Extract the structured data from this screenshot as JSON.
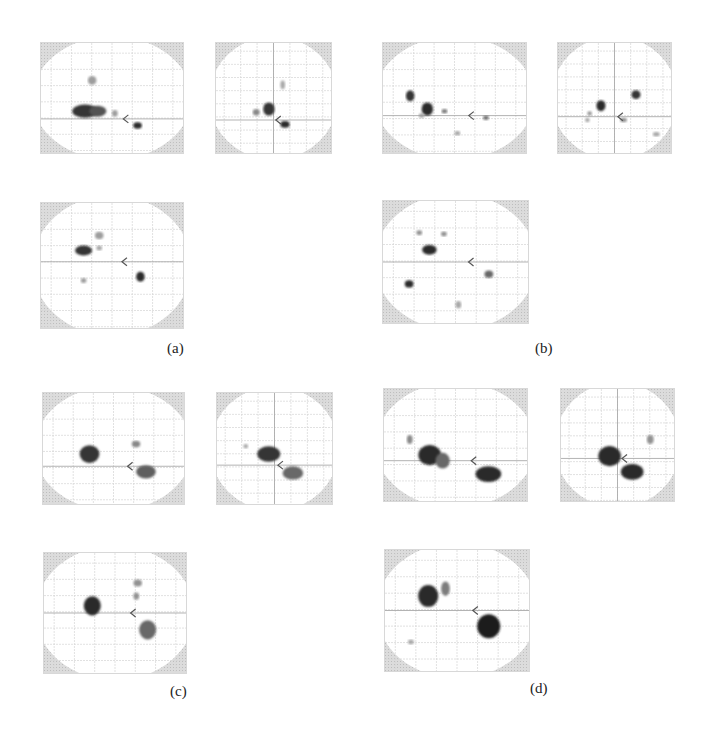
{
  "figure": {
    "panels": [
      {
        "id": "a",
        "label": "(a)",
        "views": {
          "sagittal": {
            "x": 40,
            "y": 42,
            "w": 142,
            "h": 110,
            "blobs": [
              [
                0.36,
                0.34,
                0.03,
                0.04,
                0.35
              ],
              [
                0.31,
                0.62,
                0.09,
                0.06,
                0.85
              ],
              [
                0.4,
                0.62,
                0.06,
                0.05,
                0.7
              ],
              [
                0.52,
                0.64,
                0.02,
                0.03,
                0.35
              ],
              [
                0.68,
                0.75,
                0.03,
                0.03,
                0.9
              ]
            ],
            "arrow": [
              0.58,
              0.69
            ]
          },
          "coronal": {
            "x": 215,
            "y": 42,
            "w": 115,
            "h": 110,
            "blobs": [
              [
                0.58,
                0.38,
                0.02,
                0.04,
                0.3
              ],
              [
                0.46,
                0.6,
                0.05,
                0.06,
                0.85
              ],
              [
                0.35,
                0.63,
                0.03,
                0.03,
                0.45
              ],
              [
                0.6,
                0.74,
                0.04,
                0.03,
                0.9
              ]
            ],
            "arrow": [
              0.52,
              0.7
            ]
          },
          "axial": {
            "x": 40,
            "y": 202,
            "w": 142,
            "h": 125,
            "blobs": [
              [
                0.41,
                0.26,
                0.03,
                0.03,
                0.35
              ],
              [
                0.3,
                0.38,
                0.06,
                0.04,
                0.85
              ],
              [
                0.41,
                0.36,
                0.02,
                0.02,
                0.3
              ],
              [
                0.3,
                0.62,
                0.02,
                0.02,
                0.35
              ],
              [
                0.7,
                0.59,
                0.03,
                0.04,
                0.9
              ]
            ],
            "arrow": [
              0.57,
              0.47
            ]
          }
        },
        "label_pos": {
          "x": 167,
          "y": 340
        }
      },
      {
        "id": "b",
        "label": "(b)",
        "views": {
          "sagittal": {
            "x": 382,
            "y": 42,
            "w": 143,
            "h": 110,
            "blobs": [
              [
                0.19,
                0.48,
                0.03,
                0.05,
                0.85
              ],
              [
                0.31,
                0.6,
                0.04,
                0.06,
                0.9
              ],
              [
                0.27,
                0.66,
                0.02,
                0.02,
                0.35
              ],
              [
                0.43,
                0.62,
                0.02,
                0.02,
                0.5
              ],
              [
                0.72,
                0.68,
                0.02,
                0.02,
                0.55
              ],
              [
                0.52,
                0.82,
                0.02,
                0.02,
                0.3
              ]
            ],
            "arrow": [
              0.6,
              0.66
            ]
          },
          "coronal": {
            "x": 557,
            "y": 42,
            "w": 113,
            "h": 110,
            "blobs": [
              [
                0.38,
                0.57,
                0.04,
                0.05,
                0.9
              ],
              [
                0.28,
                0.64,
                0.02,
                0.02,
                0.4
              ],
              [
                0.26,
                0.7,
                0.02,
                0.02,
                0.3
              ],
              [
                0.69,
                0.47,
                0.04,
                0.04,
                0.85
              ],
              [
                0.58,
                0.7,
                0.03,
                0.02,
                0.4
              ],
              [
                0.87,
                0.83,
                0.03,
                0.02,
                0.3
              ]
            ],
            "arrow": [
              0.53,
              0.67
            ]
          },
          "axial": {
            "x": 382,
            "y": 200,
            "w": 145,
            "h": 122,
            "blobs": [
              [
                0.25,
                0.26,
                0.02,
                0.02,
                0.4
              ],
              [
                0.42,
                0.27,
                0.02,
                0.02,
                0.4
              ],
              [
                0.32,
                0.4,
                0.05,
                0.04,
                0.9
              ],
              [
                0.73,
                0.6,
                0.03,
                0.03,
                0.6
              ],
              [
                0.18,
                0.68,
                0.03,
                0.03,
                0.9
              ],
              [
                0.52,
                0.85,
                0.02,
                0.03,
                0.3
              ]
            ],
            "arrow": [
              0.59,
              0.5
            ]
          }
        },
        "label_pos": {
          "x": 535,
          "y": 340
        }
      },
      {
        "id": "c",
        "label": "(c)",
        "views": {
          "sagittal": {
            "x": 42,
            "y": 392,
            "w": 141,
            "h": 111,
            "blobs": [
              [
                0.33,
                0.55,
                0.07,
                0.08,
                0.85
              ],
              [
                0.66,
                0.46,
                0.03,
                0.03,
                0.45
              ],
              [
                0.73,
                0.71,
                0.07,
                0.06,
                0.65
              ]
            ],
            "arrow": [
              0.6,
              0.66
            ]
          },
          "coronal": {
            "x": 216,
            "y": 392,
            "w": 115,
            "h": 111,
            "blobs": [
              [
                0.45,
                0.55,
                0.1,
                0.07,
                0.85
              ],
              [
                0.66,
                0.72,
                0.09,
                0.06,
                0.6
              ],
              [
                0.25,
                0.48,
                0.02,
                0.02,
                0.3
              ]
            ],
            "arrow": [
              0.53,
              0.65
            ]
          },
          "axial": {
            "x": 43,
            "y": 552,
            "w": 142,
            "h": 120,
            "blobs": [
              [
                0.66,
                0.25,
                0.03,
                0.03,
                0.4
              ],
              [
                0.65,
                0.36,
                0.02,
                0.03,
                0.4
              ],
              [
                0.34,
                0.44,
                0.06,
                0.08,
                0.9
              ],
              [
                0.73,
                0.64,
                0.06,
                0.08,
                0.6
              ]
            ],
            "arrow": [
              0.61,
              0.5
            ]
          }
        },
        "label_pos": {
          "x": 170,
          "y": 683
        }
      },
      {
        "id": "d",
        "label": "(d)",
        "views": {
          "sagittal": {
            "x": 383,
            "y": 388,
            "w": 143,
            "h": 112,
            "blobs": [
              [
                0.18,
                0.45,
                0.02,
                0.04,
                0.45
              ],
              [
                0.32,
                0.59,
                0.08,
                0.09,
                0.9
              ],
              [
                0.41,
                0.64,
                0.05,
                0.07,
                0.6
              ],
              [
                0.73,
                0.76,
                0.09,
                0.07,
                0.9
              ]
            ],
            "arrow": [
              0.61,
              0.64
            ]
          },
          "coronal": {
            "x": 560,
            "y": 388,
            "w": 113,
            "h": 112,
            "blobs": [
              [
                0.43,
                0.6,
                0.1,
                0.09,
                0.9
              ],
              [
                0.63,
                0.74,
                0.1,
                0.07,
                0.9
              ],
              [
                0.79,
                0.45,
                0.03,
                0.04,
                0.4
              ]
            ],
            "arrow": [
              0.54,
              0.62
            ]
          },
          "axial": {
            "x": 384,
            "y": 549,
            "w": 144,
            "h": 121,
            "blobs": [
              [
                0.3,
                0.38,
                0.07,
                0.09,
                0.9
              ],
              [
                0.42,
                0.32,
                0.03,
                0.06,
                0.5
              ],
              [
                0.72,
                0.63,
                0.08,
                0.1,
                0.95
              ],
              [
                0.18,
                0.76,
                0.02,
                0.02,
                0.3
              ]
            ],
            "arrow": [
              0.61,
              0.5
            ]
          }
        },
        "label_pos": {
          "x": 530,
          "y": 680
        }
      }
    ]
  }
}
